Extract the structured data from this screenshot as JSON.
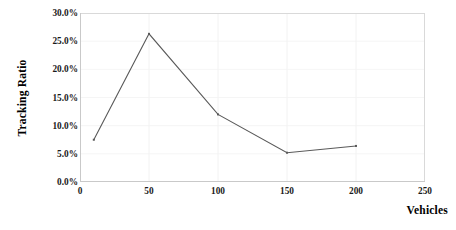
{
  "chart_data": {
    "type": "line",
    "title": "",
    "subtitle": "",
    "xlabel": "Vehicles",
    "ylabel": "Tracking Ratio",
    "xlim": [
      0,
      250
    ],
    "ylim": [
      0,
      30
    ],
    "xticks": [
      0,
      50,
      100,
      150,
      200,
      250
    ],
    "xtick_labels": [
      "0",
      "50",
      "100",
      "150",
      "200",
      "250"
    ],
    "yticks": [
      0,
      5,
      10,
      15,
      20,
      25,
      30
    ],
    "ytick_labels": [
      "0.0%",
      "5.0%",
      "10.0%",
      "15.0%",
      "20.0%",
      "25.0%",
      "30.0%"
    ],
    "grid": "vertical-faint",
    "legend": "none",
    "series": [
      {
        "name": "Tracking Ratio",
        "color": "#595959",
        "marker": "none",
        "x": [
          10,
          50,
          100,
          150,
          200
        ],
        "values": [
          7.5,
          26.3,
          12.0,
          5.2,
          6.4
        ],
        "point_labels": [
          "7.5%",
          "26.3%",
          "12.0%",
          "5.2%",
          "6.4%"
        ]
      }
    ]
  },
  "axis": {
    "y_title": "Tracking Ratio",
    "x_title": "Vehicles"
  },
  "colors": {
    "line": "#595959",
    "axis": "#d9d9d9",
    "grid": "#f2f2f2",
    "text": "#1a1a1a",
    "background": "#ffffff"
  }
}
